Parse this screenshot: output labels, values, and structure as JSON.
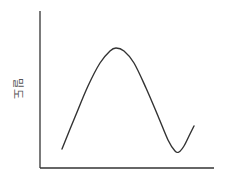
{
  "chart_data": {
    "type": "line",
    "title": "",
    "xlabel": "",
    "ylabel": "밀도",
    "grid": false,
    "legend": null,
    "axes": {
      "origin": [
        40,
        168
      ],
      "y_top": 11,
      "x_right": 214,
      "color": "#333333"
    },
    "series": [
      {
        "name": "density-curve",
        "color": "#333333",
        "points_px": [
          [
            62,
            149
          ],
          [
            75,
            117
          ],
          [
            88,
            86
          ],
          [
            100,
            63
          ],
          [
            110,
            51
          ],
          [
            116,
            48
          ],
          [
            124,
            51
          ],
          [
            134,
            63
          ],
          [
            146,
            88
          ],
          [
            158,
            116
          ],
          [
            168,
            140
          ],
          [
            175,
            151
          ],
          [
            179,
            152
          ],
          [
            184,
            146
          ],
          [
            189,
            136
          ],
          [
            194,
            126
          ]
        ]
      }
    ]
  }
}
